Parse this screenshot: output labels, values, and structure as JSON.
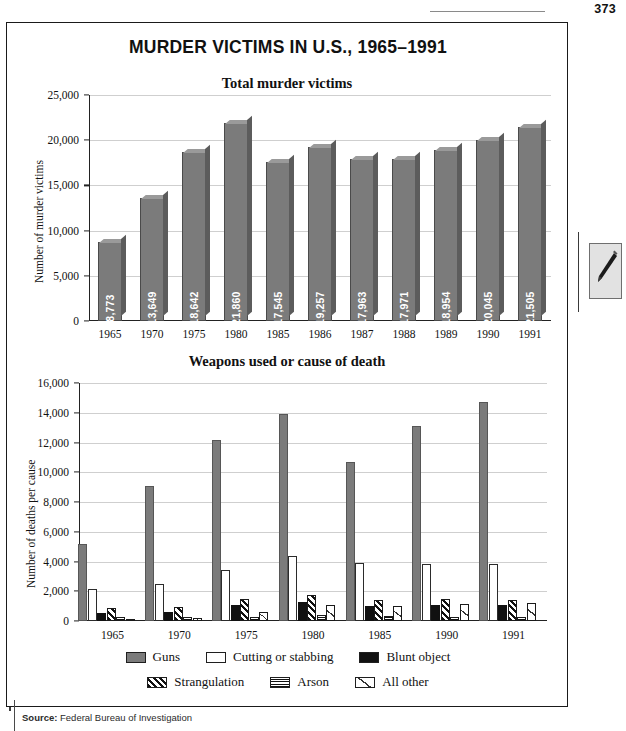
{
  "page": {
    "number": "373"
  },
  "document": {
    "title": "MURDER VICTIMS IN U.S., 1965–1991",
    "source_label": "Source:",
    "source_text": "Federal Bureau of Investigation"
  },
  "margin": {
    "pencil_icon": "pencil-icon"
  },
  "chart_data": [
    {
      "type": "bar",
      "title": "Total murder victims",
      "xlabel": "",
      "ylabel": "Number of murder victims",
      "ylim": [
        0,
        25000
      ],
      "yticks": [
        "0",
        "5,000",
        "10,000",
        "15,000",
        "20,000",
        "25,000"
      ],
      "ytick_values": [
        0,
        5000,
        10000,
        15000,
        20000,
        25000
      ],
      "grid": true,
      "legend": "none",
      "categories": [
        "1965",
        "1970",
        "1975",
        "1980",
        "1985",
        "1986",
        "1987",
        "1988",
        "1989",
        "1990",
        "1991"
      ],
      "values": [
        8773,
        13649,
        18642,
        21860,
        17545,
        19257,
        17963,
        17971,
        18954,
        20045,
        21505
      ],
      "data_labels": [
        "8,773",
        "13,649",
        "18,642",
        "21,860",
        "17,545",
        "19,257",
        "17,963",
        "17,971",
        "18,954",
        "20,045",
        "21,505"
      ],
      "bar_color": "#7b7b7b"
    },
    {
      "type": "bar",
      "title": "Weapons used or cause of death",
      "xlabel": "",
      "ylabel": "Number of deaths per cause",
      "ylim": [
        0,
        16000
      ],
      "yticks": [
        "0",
        "2,000",
        "4,000",
        "6,000",
        "8,000",
        "10,000",
        "12,000",
        "14,000",
        "16,000"
      ],
      "ytick_values": [
        0,
        2000,
        4000,
        6000,
        8000,
        10000,
        12000,
        14000,
        16000
      ],
      "grid": true,
      "legend": "bottom",
      "categories": [
        "1965",
        "1970",
        "1975",
        "1980",
        "1985",
        "1990",
        "1991"
      ],
      "series": [
        {
          "name": "Guns",
          "pattern": "solid-gray",
          "color": "#7b7b7b",
          "values": [
            5200,
            9100,
            12200,
            13900,
            10700,
            13100,
            14700
          ]
        },
        {
          "name": "Cutting or stabbing",
          "pattern": "white",
          "color": "#ffffff",
          "values": [
            2150,
            2500,
            3400,
            4400,
            3900,
            3800,
            3800
          ]
        },
        {
          "name": "Blunt object",
          "pattern": "solid-black",
          "color": "#111111",
          "values": [
            560,
            600,
            1050,
            1300,
            1000,
            1100,
            1100
          ]
        },
        {
          "name": "Strangulation",
          "pattern": "diagonal",
          "color": "#111111",
          "values": [
            900,
            950,
            1450,
            1750,
            1400,
            1450,
            1400
          ]
        },
        {
          "name": "Arson",
          "pattern": "checkered",
          "color": "#111111",
          "values": [
            300,
            300,
            300,
            400,
            350,
            300,
            300
          ]
        },
        {
          "name": "All other",
          "pattern": "light-diag",
          "color": "#333333",
          "values": [
            150,
            200,
            600,
            1100,
            1000,
            1150,
            1200
          ]
        }
      ]
    }
  ]
}
